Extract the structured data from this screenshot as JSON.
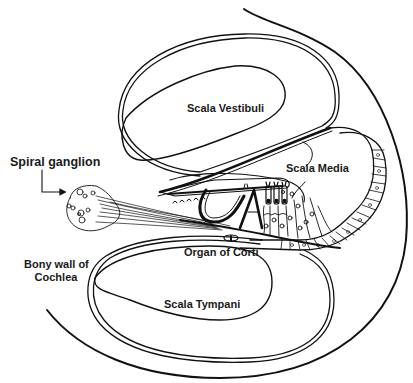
{
  "diagram": {
    "colors": {
      "stroke": "#111111",
      "background": "#ffffff"
    },
    "labels": {
      "scala_vestibuli": "Scala Vestibuli",
      "scala_media": "Scala Media",
      "spiral_ganglion": "Spiral ganglion",
      "organ_of_corti": "Organ of Corti",
      "bony_wall_line1": "Bony wall of",
      "bony_wall_line2": "Cochlea",
      "scala_tympani": "Scala Tympani"
    }
  }
}
